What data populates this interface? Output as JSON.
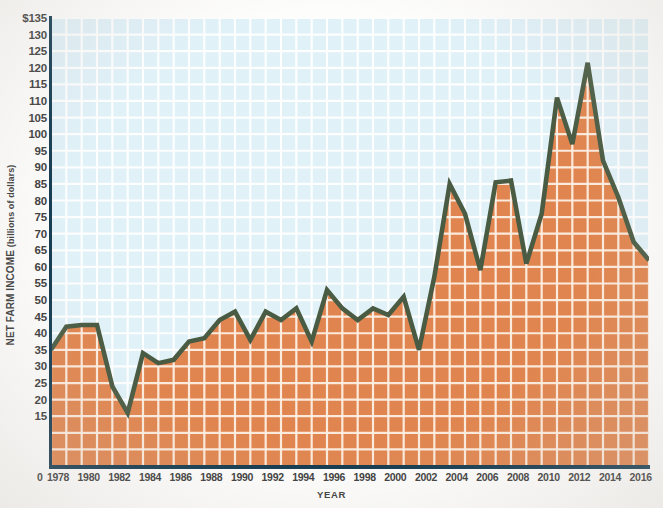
{
  "chart_data": {
    "type": "area",
    "title": "",
    "xlabel": "YEAR",
    "ylabel": "NET FARM INCOME",
    "ylabel_unit": "(billions of dollars)",
    "xlim": [
      1978,
      2017
    ],
    "ylim": [
      0,
      135
    ],
    "y_tick_step": 5,
    "x_tick_step": 2,
    "grid": true,
    "legend": "none",
    "origin_label": "0",
    "area_fill_color": "#e0854f",
    "line_color": "#4a5b43",
    "plot_background_color": "#e0f1f8",
    "gridline_color": "#ffffff",
    "axis_color": "#12394f",
    "y_ticks": [
      "$135",
      "130",
      "125",
      "120",
      "115",
      "110",
      "105",
      "100",
      "95",
      "90",
      "85",
      "80",
      "75",
      "70",
      "65",
      "60",
      "55",
      "50",
      "45",
      "40",
      "35",
      "30",
      "25",
      "20",
      "15"
    ],
    "y_tick_values": [
      135,
      130,
      125,
      120,
      115,
      110,
      105,
      100,
      95,
      90,
      85,
      80,
      75,
      70,
      65,
      60,
      55,
      50,
      45,
      40,
      35,
      30,
      25,
      20,
      15
    ],
    "x_ticks": [
      "1978",
      "1980",
      "1982",
      "1984",
      "1986",
      "1988",
      "1990",
      "1992",
      "1994",
      "1996",
      "1998",
      "2000",
      "2002",
      "2004",
      "2006",
      "2008",
      "2010",
      "2012",
      "2014",
      "2016"
    ],
    "x_tick_values": [
      1978,
      1980,
      1982,
      1984,
      1986,
      1988,
      1990,
      1992,
      1994,
      1996,
      1998,
      2000,
      2002,
      2004,
      2006,
      2008,
      2010,
      2012,
      2014,
      2016
    ],
    "x": [
      1978,
      1979,
      1980,
      1981,
      1982,
      1983,
      1984,
      1985,
      1986,
      1987,
      1988,
      1989,
      1990,
      1991,
      1992,
      1993,
      1994,
      1995,
      1996,
      1997,
      1998,
      1999,
      2000,
      2001,
      2002,
      2003,
      2004,
      2005,
      2006,
      2007,
      2008,
      2009,
      2010,
      2011,
      2012,
      2013,
      2014,
      2015,
      2016,
      2017
    ],
    "values": [
      35,
      42,
      42.5,
      42.5,
      24,
      16,
      34,
      31,
      32,
      37.5,
      38.5,
      44,
      46.5,
      38,
      46.5,
      44,
      47.5,
      37.5,
      53,
      47.5,
      44,
      47.5,
      45.5,
      51,
      35,
      57,
      85,
      76,
      59,
      85.5,
      86,
      61,
      76,
      111,
      97,
      121.5,
      92,
      81,
      67.5,
      62
    ]
  }
}
